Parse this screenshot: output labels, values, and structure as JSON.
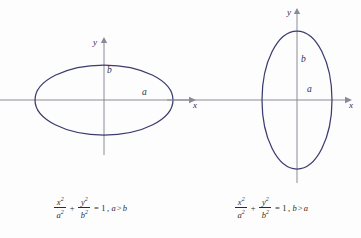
{
  "figure": {
    "stroke_color": "#3c3c6e",
    "axis_color": "#8a8a96",
    "background": "#fdfdfd",
    "panels": [
      {
        "id": "horizontal-ellipse",
        "name": "wide-ellipse-a-greater-than-b",
        "axes": {
          "x_label": "x",
          "y_label": "y"
        },
        "segments": {
          "semi_major_label": "a",
          "semi_minor_label": "b"
        },
        "ellipse": {
          "cx": 104,
          "cy": 100,
          "rx": 69,
          "ry": 35,
          "orientation": "horizontal"
        },
        "equation": {
          "x_num": "x",
          "x_num_sup": "2",
          "x_den": "a",
          "x_den_sup": "2",
          "plus": "+",
          "y_num": "y",
          "y_num_sup": "2",
          "y_den": "b",
          "y_den_sup": "2",
          "equals": "=",
          "rhs": "1",
          "comma": ",",
          "cond_left": "a",
          "cond_rel": ">",
          "cond_right": "b",
          "plain": "x²/a² + y²/b² = 1, a > b"
        }
      },
      {
        "id": "vertical-ellipse",
        "name": "tall-ellipse-b-greater-than-a",
        "axes": {
          "x_label": "x",
          "y_label": "y"
        },
        "segments": {
          "semi_major_label": "b",
          "semi_minor_label": "a"
        },
        "ellipse": {
          "cx": 116,
          "cy": 100,
          "rx": 35,
          "ry": 69,
          "orientation": "vertical"
        },
        "equation": {
          "x_num": "x",
          "x_num_sup": "2",
          "x_den": "a",
          "x_den_sup": "2",
          "plus": "+",
          "y_num": "y",
          "y_num_sup": "2",
          "y_den": "b",
          "y_den_sup": "2",
          "equals": "=",
          "rhs": "1",
          "comma": ",",
          "cond_left": "b",
          "cond_rel": ">",
          "cond_right": "a",
          "plain": "x²/a² + y²/b² = 1, b > a"
        }
      }
    ]
  }
}
